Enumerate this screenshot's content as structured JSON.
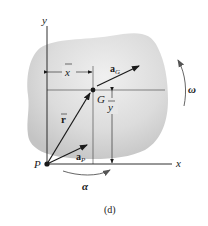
{
  "figure": {
    "caption": "(d)",
    "colors": {
      "body_fill": "#d6d6d6",
      "body_highlight": "#eeeeee",
      "line": "#1a1a1a",
      "rotation_arrow": "#555555"
    },
    "axes": {
      "x_label": "x",
      "y_label": "y"
    },
    "points": {
      "origin_label": "P",
      "center_label": "G"
    },
    "vectors": {
      "position": {
        "symbol": "r",
        "bar": true,
        "bold": true
      },
      "accel_G": {
        "symbol": "a",
        "subscript": "G",
        "bold": true
      },
      "accel_P": {
        "symbol": "a",
        "subscript": "P",
        "bold": true
      }
    },
    "dimensions": {
      "x_bar": "x",
      "y_bar": "y"
    },
    "rotation": {
      "omega": "ω",
      "alpha": "α"
    }
  }
}
